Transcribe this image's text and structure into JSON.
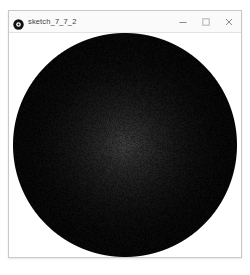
{
  "window": {
    "title": "sketch_7_7_2",
    "icon": "processing-logo-icon",
    "frame_color": "#c8c8c8",
    "titlebar_color": "#fafafa",
    "title_text_color": "#3c3c3c",
    "controls": [
      {
        "name": "minimize",
        "glyph": "minimize-icon",
        "label": "Minimize"
      },
      {
        "name": "maximize",
        "glyph": "maximize-icon",
        "label": "Maximize"
      },
      {
        "name": "close",
        "glyph": "close-icon",
        "label": "Close"
      }
    ]
  },
  "sketch": {
    "description": "black-noise-circle",
    "background_color": "#ffffff",
    "shape": "circle",
    "circle": {
      "center_x_pct": 50,
      "center_y_pct": 50,
      "radius_pct": 50,
      "center_color": "#383838",
      "edge_color": "#0a0a0a",
      "outer_color": "#000000",
      "noise": true,
      "noise_amount": 26
    }
  }
}
